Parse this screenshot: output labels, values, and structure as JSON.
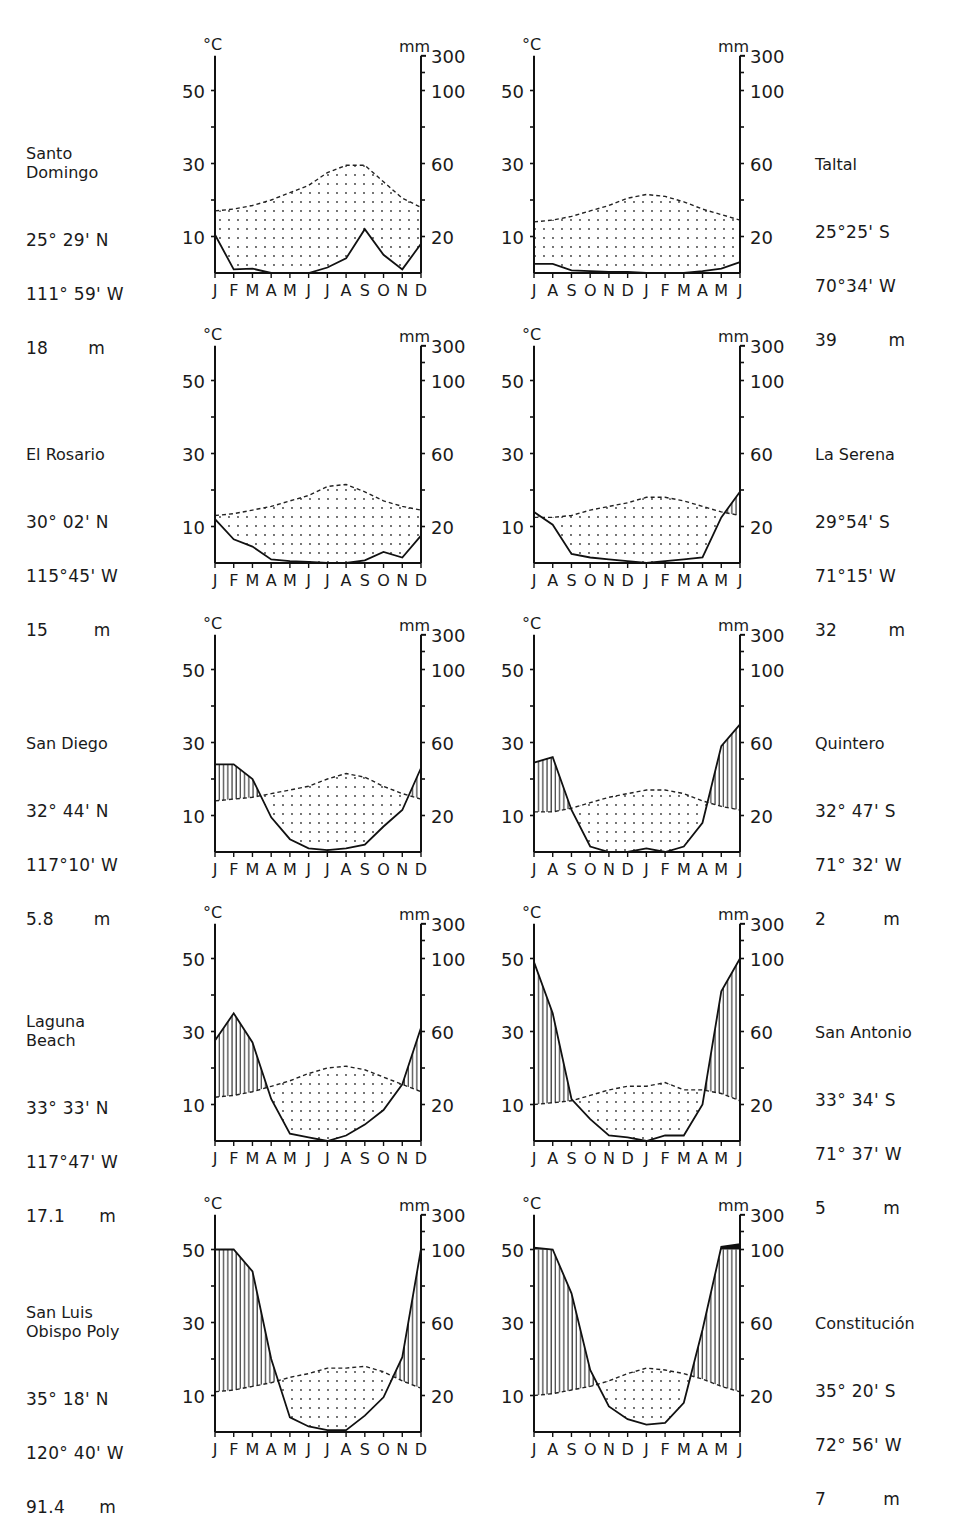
{
  "figure": {
    "axis_labels": {
      "left_unit": "°C",
      "right_unit": "mm"
    },
    "left_ticks": [
      "50",
      "30",
      "10"
    ],
    "right_ticks": [
      "300",
      "100",
      "60",
      "20"
    ],
    "months_north": [
      "J",
      "F",
      "M",
      "A",
      "M",
      "J",
      "J",
      "A",
      "S",
      "O",
      "N",
      "D"
    ],
    "months_south": [
      "J",
      "A",
      "S",
      "O",
      "N",
      "D",
      "J",
      "F",
      "M",
      "A",
      "M",
      "J"
    ]
  },
  "stations": [
    {
      "name": "Santo\nDomingo",
      "lat": "25° 29' N",
      "lon": "111° 59' W",
      "elev": "18       m",
      "side": "left",
      "row": 0
    },
    {
      "name": "Taltal",
      "lat": "25°25' S",
      "lon": "70°34' W",
      "elev": "39         m",
      "side": "right",
      "row": 0
    },
    {
      "name": "El Rosario",
      "lat": "30° 02' N",
      "lon": "115°45' W",
      "elev": "15        m",
      "side": "left",
      "row": 1
    },
    {
      "name": "La Serena",
      "lat": "29°54' S",
      "lon": "71°15' W",
      "elev": "32         m",
      "side": "right",
      "row": 1
    },
    {
      "name": "San Diego",
      "lat": "32° 44' N",
      "lon": "117°10' W",
      "elev": "5.8       m",
      "side": "left",
      "row": 2
    },
    {
      "name": "Quintero",
      "lat": "32° 47' S",
      "lon": "71° 32' W",
      "elev": "2          m",
      "side": "right",
      "row": 2
    },
    {
      "name": "Laguna\nBeach",
      "lat": "33° 33' N",
      "lon": "117°47' W",
      "elev": "17.1      m",
      "side": "left",
      "row": 3
    },
    {
      "name": "San Antonio",
      "lat": "33° 34' S",
      "lon": "71° 37' W",
      "elev": "5          m",
      "side": "right",
      "row": 3
    },
    {
      "name": "San Luis\nObispo Poly",
      "lat": "35° 18' N",
      "lon": "120° 40' W",
      "elev": "91.4      m",
      "side": "left",
      "row": 4
    },
    {
      "name": "Constitución",
      "lat": "35° 20' S",
      "lon": "72° 56' W",
      "elev": "7          m",
      "side": "right",
      "row": 4
    }
  ],
  "chart_data": [
    {
      "type": "line",
      "title": "Santo Domingo",
      "hemisphere": "N",
      "x": [
        "J",
        "F",
        "M",
        "A",
        "M",
        "J",
        "J",
        "A",
        "S",
        "O",
        "N",
        "D"
      ],
      "series": [
        {
          "name": "Temperature (°C)",
          "style": "dashed",
          "values": [
            17,
            17.5,
            18.5,
            20,
            22,
            24,
            27.5,
            29.5,
            29.5,
            25,
            20.5,
            18
          ]
        },
        {
          "name": "Precipitation (mm)",
          "style": "solid",
          "values": [
            21,
            2,
            2.4,
            0,
            0,
            0,
            3,
            8,
            24,
            10,
            2,
            16
          ]
        }
      ],
      "ylabel_left": "°C",
      "ylabel_right": "mm",
      "ylim_left": [
        0,
        60
      ]
    },
    {
      "type": "line",
      "title": "Taltal",
      "hemisphere": "S",
      "x": [
        "J",
        "A",
        "S",
        "O",
        "N",
        "D",
        "J",
        "F",
        "M",
        "A",
        "M",
        "J"
      ],
      "series": [
        {
          "name": "Temperature (°C)",
          "style": "dashed",
          "values": [
            14,
            14.5,
            15.5,
            17,
            18.5,
            20.5,
            21.5,
            21,
            19.5,
            17.5,
            16,
            14.5
          ]
        },
        {
          "name": "Precipitation (mm)",
          "style": "solid",
          "values": [
            5,
            5,
            1.5,
            1,
            0.6,
            0.6,
            0,
            0,
            0,
            1,
            2.4,
            6
          ]
        }
      ],
      "ylabel_left": "°C",
      "ylabel_right": "mm",
      "ylim_left": [
        0,
        60
      ]
    },
    {
      "type": "line",
      "title": "El Rosario",
      "hemisphere": "N",
      "x": [
        "J",
        "F",
        "M",
        "A",
        "M",
        "J",
        "J",
        "A",
        "S",
        "O",
        "N",
        "D"
      ],
      "series": [
        {
          "name": "Temperature (°C)",
          "style": "dashed",
          "values": [
            13,
            13.5,
            14.5,
            15.5,
            17,
            18.5,
            21,
            21.5,
            19.5,
            17,
            15.5,
            14.5
          ]
        },
        {
          "name": "Precipitation (mm)",
          "style": "solid",
          "values": [
            24,
            13,
            9,
            2,
            1,
            0.6,
            0,
            0,
            1.4,
            6,
            3,
            15
          ]
        }
      ],
      "ylabel_left": "°C",
      "ylabel_right": "mm",
      "ylim_left": [
        0,
        60
      ]
    },
    {
      "type": "line",
      "title": "La Serena",
      "hemisphere": "S",
      "x": [
        "J",
        "A",
        "S",
        "O",
        "N",
        "D",
        "J",
        "F",
        "M",
        "A",
        "M",
        "J"
      ],
      "series": [
        {
          "name": "Temperature (°C)",
          "style": "dashed",
          "values": [
            12.5,
            12.5,
            13,
            14.5,
            15.5,
            16.5,
            18,
            18,
            17,
            15.5,
            14,
            13
          ]
        },
        {
          "name": "Precipitation (mm)",
          "style": "solid",
          "values": [
            28,
            21,
            5,
            3,
            2,
            1,
            0,
            1,
            2,
            3,
            25,
            39
          ]
        }
      ],
      "ylabel_left": "°C",
      "ylabel_right": "mm",
      "ylim_left": [
        0,
        60
      ]
    },
    {
      "type": "line",
      "title": "San Diego",
      "hemisphere": "N",
      "x": [
        "J",
        "F",
        "M",
        "A",
        "M",
        "J",
        "J",
        "A",
        "S",
        "O",
        "N",
        "D"
      ],
      "series": [
        {
          "name": "Temperature (°C)",
          "style": "dashed",
          "values": [
            14,
            14.5,
            15,
            16,
            17,
            18,
            20,
            21.5,
            20.5,
            18,
            16,
            14.5
          ]
        },
        {
          "name": "Precipitation (mm)",
          "style": "solid",
          "values": [
            48,
            48,
            40,
            19,
            7,
            2,
            1,
            2,
            4,
            14,
            23,
            46
          ]
        }
      ],
      "ylabel_left": "°C",
      "ylabel_right": "mm",
      "ylim_left": [
        0,
        60
      ]
    },
    {
      "type": "line",
      "title": "Quintero",
      "hemisphere": "S",
      "x": [
        "J",
        "A",
        "S",
        "O",
        "N",
        "D",
        "J",
        "F",
        "M",
        "A",
        "M",
        "J"
      ],
      "series": [
        {
          "name": "Temperature (°C)",
          "style": "dashed",
          "values": [
            11,
            11,
            12,
            13.5,
            15,
            16,
            17,
            17,
            16,
            14,
            12.5,
            11.5
          ]
        },
        {
          "name": "Precipitation (mm)",
          "style": "solid",
          "values": [
            49,
            52,
            23,
            3,
            0,
            0,
            2,
            0,
            3,
            16,
            58,
            70
          ]
        }
      ],
      "ylabel_left": "°C",
      "ylabel_right": "mm",
      "ylim_left": [
        0,
        60
      ]
    },
    {
      "type": "line",
      "title": "Laguna Beach",
      "hemisphere": "N",
      "x": [
        "J",
        "F",
        "M",
        "A",
        "M",
        "J",
        "J",
        "A",
        "S",
        "O",
        "N",
        "D"
      ],
      "series": [
        {
          "name": "Temperature (°C)",
          "style": "dashed",
          "values": [
            12,
            12.5,
            13.5,
            15,
            16.5,
            18.5,
            20,
            20.5,
            19.5,
            17.5,
            15.5,
            13.5
          ]
        },
        {
          "name": "Precipitation (mm)",
          "style": "solid",
          "values": [
            55,
            70,
            54,
            23,
            4,
            2,
            0,
            3,
            9,
            17,
            31,
            62
          ]
        }
      ],
      "ylabel_left": "°C",
      "ylabel_right": "mm",
      "ylim_left": [
        0,
        60
      ]
    },
    {
      "type": "line",
      "title": "San Antonio",
      "hemisphere": "S",
      "x": [
        "J",
        "A",
        "S",
        "O",
        "N",
        "D",
        "J",
        "F",
        "M",
        "A",
        "M",
        "J"
      ],
      "series": [
        {
          "name": "Temperature (°C)",
          "style": "dashed",
          "values": [
            10,
            10.5,
            11,
            12.5,
            14,
            15,
            15,
            16,
            14,
            14,
            13,
            11
          ]
        },
        {
          "name": "Precipitation (mm)",
          "style": "solid",
          "values": [
            98,
            70,
            23,
            12,
            3,
            2,
            0,
            3,
            3,
            20,
            82,
            100
          ]
        }
      ],
      "ylabel_left": "°C",
      "ylabel_right": "mm",
      "ylim_left": [
        0,
        60
      ]
    },
    {
      "type": "line",
      "title": "San Luis Obispo Poly",
      "hemisphere": "N",
      "x": [
        "J",
        "F",
        "M",
        "A",
        "M",
        "J",
        "J",
        "A",
        "S",
        "O",
        "N",
        "D"
      ],
      "series": [
        {
          "name": "Temperature (°C)",
          "style": "dashed",
          "values": [
            11,
            11.5,
            12.5,
            13.5,
            15,
            16,
            17.5,
            17.5,
            18,
            16.5,
            14,
            12
          ]
        },
        {
          "name": "Precipitation (mm)",
          "style": "solid",
          "values": [
            100,
            100,
            88,
            40,
            8,
            3,
            1,
            1,
            9,
            19,
            41,
            102
          ]
        }
      ],
      "ylabel_left": "°C",
      "ylabel_right": "mm",
      "ylim_left": [
        0,
        60
      ]
    },
    {
      "type": "line",
      "title": "Constitución",
      "hemisphere": "S",
      "x": [
        "J",
        "A",
        "S",
        "O",
        "N",
        "D",
        "J",
        "F",
        "M",
        "A",
        "M",
        "J"
      ],
      "series": [
        {
          "name": "Temperature (°C)",
          "style": "dashed",
          "values": [
            10,
            10.5,
            11.5,
            12.5,
            14,
            16,
            17.5,
            17,
            16,
            14.5,
            12.5,
            11
          ]
        },
        {
          "name": "Precipitation (mm)",
          "style": "solid",
          "values": [
            110,
            100,
            76,
            34,
            14,
            7,
            4,
            5,
            16,
            56,
            115,
            130
          ]
        }
      ],
      "ylabel_left": "°C",
      "ylabel_right": "mm",
      "ylim_left": [
        0,
        60
      ]
    }
  ]
}
